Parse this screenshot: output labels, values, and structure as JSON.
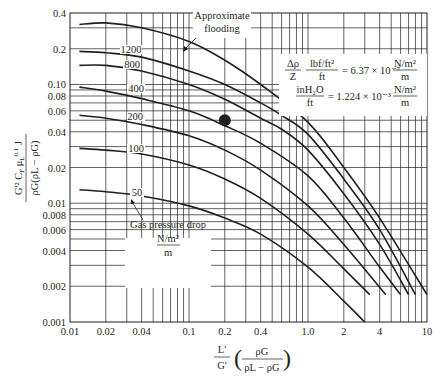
{
  "chart_data": {
    "type": "line",
    "xscale": "log",
    "yscale": "log",
    "xlim": [
      0.01,
      10
    ],
    "ylim": [
      0.001,
      0.4
    ],
    "grid": true,
    "xlabel": "L' / G' (ρG / (ρL − ρG))",
    "xlabel_parts": {
      "num": "L'",
      "den": "G'",
      "paren_num": "ρG",
      "paren_den": "ρL − ρG"
    },
    "ylabel": "G'² CF μL^0.1 J / (ρG (ρL − ρG))",
    "ylabel_parts": {
      "num": "G'² CF μL0.1 J",
      "den": "ρG(ρL − ρG)"
    },
    "xticks": [
      0.01,
      0.02,
      0.04,
      0.1,
      0.2,
      0.4,
      1.0,
      2,
      4,
      10
    ],
    "xtick_labels": [
      "0.01",
      "0.02",
      "0.04",
      "0.1",
      "0.2",
      "0.4",
      "1.0",
      "2",
      "4",
      "10"
    ],
    "yticks": [
      0.001,
      0.002,
      0.004,
      0.006,
      0.008,
      0.01,
      0.02,
      0.04,
      0.06,
      0.08,
      0.1,
      0.2,
      0.4
    ],
    "ytick_labels": [
      "0.001",
      "0.002",
      "0.004",
      "0.006",
      "0.008",
      "0.01",
      "0.02",
      "0.04",
      "0.06",
      "0.08",
      "0.10",
      "0.2",
      "0.4"
    ],
    "series": [
      {
        "name": "Approximate flooding",
        "x": [
          0.012,
          0.02,
          0.04,
          0.1,
          0.2,
          0.4,
          1.0,
          2,
          4,
          10
        ],
        "y": [
          0.32,
          0.33,
          0.3,
          0.23,
          0.16,
          0.1,
          0.048,
          0.02,
          0.0075,
          0.0017
        ]
      },
      {
        "name": "1200",
        "x": [
          0.012,
          0.02,
          0.04,
          0.1,
          0.2,
          0.4,
          0.6,
          1.0,
          2,
          4,
          8
        ],
        "y": [
          0.19,
          0.185,
          0.17,
          0.13,
          0.1,
          0.07,
          0.055,
          0.038,
          0.016,
          0.006,
          0.0017
        ]
      },
      {
        "name": "800",
        "x": [
          0.012,
          0.02,
          0.04,
          0.1,
          0.2,
          0.4,
          0.6,
          1.0,
          2,
          4,
          7
        ],
        "y": [
          0.145,
          0.145,
          0.13,
          0.1,
          0.075,
          0.052,
          0.042,
          0.028,
          0.012,
          0.0045,
          0.0017
        ]
      },
      {
        "name": "400",
        "x": [
          0.012,
          0.02,
          0.04,
          0.1,
          0.2,
          0.4,
          1.0,
          2,
          4,
          6
        ],
        "y": [
          0.095,
          0.088,
          0.076,
          0.06,
          0.045,
          0.032,
          0.017,
          0.0075,
          0.0029,
          0.0017
        ]
      },
      {
        "name": "200",
        "x": [
          0.012,
          0.02,
          0.04,
          0.1,
          0.2,
          0.4,
          1.0,
          2,
          4.5
        ],
        "y": [
          0.055,
          0.052,
          0.046,
          0.037,
          0.028,
          0.019,
          0.0095,
          0.0045,
          0.0017
        ]
      },
      {
        "name": "100",
        "x": [
          0.012,
          0.02,
          0.04,
          0.1,
          0.2,
          0.4,
          1.0,
          2,
          3.3
        ],
        "y": [
          0.029,
          0.028,
          0.026,
          0.021,
          0.016,
          0.011,
          0.0055,
          0.0028,
          0.0017
        ]
      },
      {
        "name": "50",
        "x": [
          0.012,
          0.02,
          0.04,
          0.1,
          0.2,
          0.4,
          1.0,
          2,
          3
        ],
        "y": [
          0.013,
          0.0125,
          0.0115,
          0.0095,
          0.0075,
          0.0055,
          0.0029,
          0.0015,
          0.001
        ]
      }
    ],
    "marker": {
      "x": 0.2,
      "y": 0.05
    },
    "annotations": [
      {
        "text": "Approximate flooding",
        "x": 0.6,
        "y": 0.28
      },
      {
        "text": "Gas pressure drop N/m²/m",
        "x": 0.15,
        "y": 0.0055
      },
      {
        "text": "Δρ/Z  lbf/ft² / ft = 6.37 × 10⁻⁷ N/m²/m",
        "x": 3,
        "y": 0.13
      },
      {
        "text": "inH2O / ft = 1.224 × 10⁻³ N/m²/m",
        "x": 3,
        "y": 0.085
      }
    ]
  },
  "labels": {
    "flood_line1": "Approximate",
    "flood_line2": "flooding",
    "curve_1200": "1200",
    "curve_800": "800",
    "curve_400": "400",
    "curve_200": "200",
    "curve_100": "100",
    "curve_50": "50",
    "gpd": "Gas pressure drop",
    "gpd_num": "N/m²",
    "gpd_den": "m",
    "conv_dp": "Δρ",
    "conv_z": "Z",
    "conv_lbf": "lbf/ft²",
    "conv_ft1": "ft",
    "conv_eq1": "= 6.37 × 10⁻⁷",
    "conv_nm1": "N/m²",
    "conv_m1": "m",
    "conv_inh2o": "inH₂O",
    "conv_ft2": "ft",
    "conv_eq2": "= 1.224 × 10⁻³",
    "conv_nm2": "N/m²",
    "conv_m2": "m",
    "y_num": "G'² C",
    "y_den": "ρG(ρL − ρG)",
    "x_num": "L'",
    "x_den": "G'",
    "x_pnum": "ρG",
    "x_pden": "ρL − ρG"
  }
}
